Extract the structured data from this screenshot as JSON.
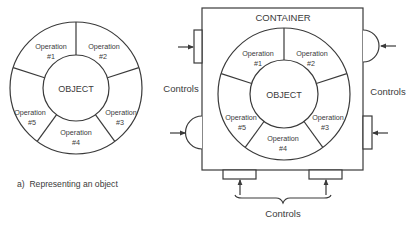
{
  "panel_a": {
    "object_label": "OBJECT",
    "operations": [
      {
        "line1": "Operation",
        "line2": "#1"
      },
      {
        "line1": "Operation",
        "line2": "#2"
      },
      {
        "line1": "Operation",
        "line2": "#3"
      },
      {
        "line1": "Operation",
        "line2": "#4"
      },
      {
        "line1": "Operation",
        "line2": "#5"
      }
    ],
    "caption": "a)  Representing an object"
  },
  "panel_b": {
    "container_label": "CONTAINER",
    "object_label": "OBJECT",
    "operations": [
      {
        "line1": "Operation",
        "line2": "#1"
      },
      {
        "line1": "Operation",
        "line2": "#2"
      },
      {
        "line1": "Operation",
        "line2": "#3"
      },
      {
        "line1": "Operation",
        "line2": "#4"
      },
      {
        "line1": "Operation",
        "line2": "#5"
      }
    ],
    "controls_left_label": "Controls",
    "controls_right_label": "Controls",
    "controls_bottom_label": "Controls"
  },
  "colors": {
    "line": "#3a3a3a",
    "background": "#ffffff",
    "text": "#3a3a3a"
  }
}
